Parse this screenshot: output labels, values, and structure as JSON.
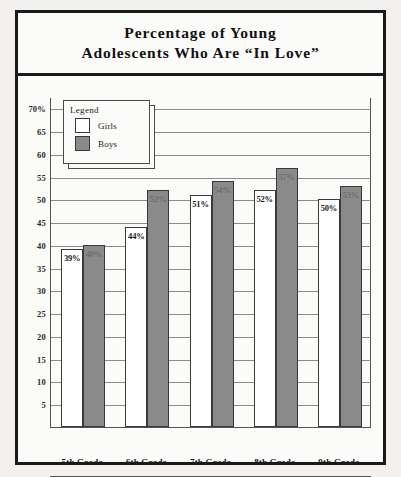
{
  "title": {
    "line1": "Percentage of Young",
    "line2": "Adolescents Who Are “In Love”"
  },
  "legend": {
    "heading": "Legend",
    "entries": [
      {
        "label": "Girls",
        "color": "#ffffff"
      },
      {
        "label": "Boys",
        "color": "#8a8a8a"
      }
    ]
  },
  "axis": {
    "y_ticks": [
      "70%",
      "65",
      "60",
      "55",
      "50",
      "45",
      "40",
      "35",
      "30",
      "25",
      "20",
      "15",
      "10",
      "5"
    ]
  },
  "bar_labels": {
    "g5_girls": "39%",
    "g5_boys": "40%",
    "g6_girls": "44%",
    "g6_boys": "52%",
    "g7_girls": "51%",
    "g7_boys": "54%",
    "g8_girls": "52%",
    "g8_boys": "57%",
    "g9_girls": "50%",
    "g9_boys": "53%"
  },
  "x_labels": {
    "g5": "5th Grade",
    "g6": "6th Grade",
    "g7": "7th Grade",
    "g8": "8th Grade",
    "g9": "9th Grade"
  },
  "chart_data": {
    "type": "bar",
    "title": "Percentage of Young Adolescents Who Are “In Love”",
    "xlabel": "",
    "ylabel": "",
    "ylim": [
      0,
      72.5
    ],
    "grid": true,
    "grid_values": [
      5,
      10,
      15,
      20,
      25,
      30,
      35,
      40,
      45,
      50,
      55,
      60,
      65,
      70
    ],
    "legend_position": "upper-left-inside",
    "categories": [
      "5th Grade",
      "6th Grade",
      "7th Grade",
      "8th Grade",
      "9th Grade"
    ],
    "series": [
      {
        "name": "Girls",
        "color": "#ffffff",
        "values": [
          39,
          44,
          51,
          52,
          50
        ],
        "labels": [
          "39%",
          "44%",
          "51%",
          "52%",
          "50%"
        ]
      },
      {
        "name": "Boys",
        "color": "#8a8a8a",
        "values": [
          40,
          52,
          54,
          57,
          53
        ],
        "labels": [
          "40%",
          "52%",
          "54%",
          "57%",
          "53%"
        ]
      }
    ]
  }
}
